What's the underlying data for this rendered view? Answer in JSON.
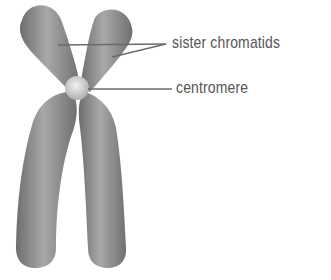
{
  "diagram": {
    "labels": [
      {
        "id": "sister-chromatids",
        "text": "sister chromatids"
      },
      {
        "id": "centromere",
        "text": "centromere"
      }
    ],
    "colors": {
      "chromatid": "#7a7a7a",
      "chromatid_highlight": "#b8b8b8",
      "centromere": "#d8d8d8",
      "leader_line": "#6a6a6a",
      "label_text": "#555555"
    }
  }
}
